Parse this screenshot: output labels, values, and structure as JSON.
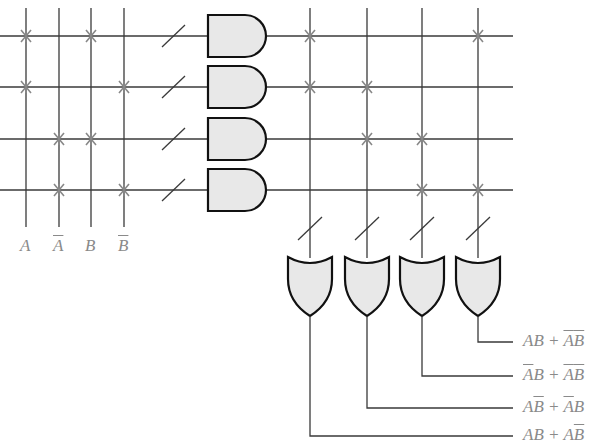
{
  "diagram": {
    "colors": {
      "wire": "#3a3a3a",
      "fuse": "#888888",
      "gate_fill": "#e8e8e8",
      "gate_stroke": "#111111",
      "label": "#8a8a8a"
    },
    "inputs": [
      {
        "name": "A",
        "complement": false,
        "x": 26
      },
      {
        "name": "A",
        "complement": true,
        "x": 59
      },
      {
        "name": "B",
        "complement": false,
        "x": 91
      },
      {
        "name": "B",
        "complement": true,
        "x": 124
      }
    ],
    "product_rows_y": [
      36,
      87,
      139,
      190
    ],
    "and_gates": [
      {
        "id": "and-1",
        "connections": [
          "A",
          "B"
        ],
        "term": "AB"
      },
      {
        "id": "and-2",
        "connections": [
          "A",
          "B'"
        ],
        "term": "AB'"
      },
      {
        "id": "and-3",
        "connections": [
          "A'",
          "B"
        ],
        "term": "A'B"
      },
      {
        "id": "and-4",
        "connections": [
          "A'",
          "B'"
        ],
        "term": "A'B'"
      }
    ],
    "or_columns_x": [
      310,
      367,
      422,
      478
    ],
    "or_connections": [
      {
        "column": 0,
        "rows": [
          0,
          1
        ]
      },
      {
        "column": 1,
        "rows": [
          1,
          2
        ]
      },
      {
        "column": 2,
        "rows": [
          2,
          3
        ]
      },
      {
        "column": 3,
        "rows": [
          0,
          3
        ]
      }
    ],
    "outputs": [
      {
        "from_or": 3,
        "y": 342,
        "label_parts": [
          {
            "t": "AB",
            "ov": false
          },
          {
            "t": " + ",
            "ov": false
          },
          {
            "t": "A",
            "ov": true
          },
          {
            "t": "B",
            "ov": true
          }
        ]
      },
      {
        "from_or": 2,
        "y": 376,
        "label_parts": [
          {
            "t": "A",
            "ov": true
          },
          {
            "t": "B",
            "ov": false
          },
          {
            "t": " + ",
            "ov": false
          },
          {
            "t": "A",
            "ov": true
          },
          {
            "t": "B",
            "ov": true
          }
        ]
      },
      {
        "from_or": 1,
        "y": 408,
        "label_parts": [
          {
            "t": "A",
            "ov": false
          },
          {
            "t": "B",
            "ov": true
          },
          {
            "t": " + ",
            "ov": false
          },
          {
            "t": "A",
            "ov": true
          },
          {
            "t": "B",
            "ov": false
          }
        ]
      },
      {
        "from_or": 0,
        "y": 436,
        "label_parts": [
          {
            "t": "AB",
            "ov": false
          },
          {
            "t": " + ",
            "ov": false
          },
          {
            "t": "A",
            "ov": false
          },
          {
            "t": "B",
            "ov": true
          }
        ]
      }
    ],
    "output_labels": [
      "AB + A̅B̅",
      "A̅B + A̅B̅",
      "AB̅ + A̅B",
      "AB + AB̅"
    ]
  }
}
